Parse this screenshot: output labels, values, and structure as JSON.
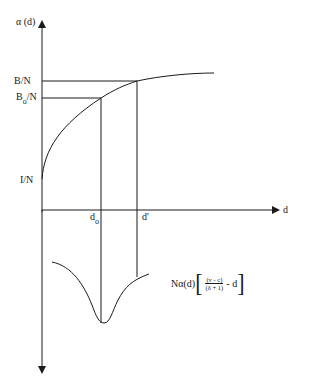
{
  "diagram": {
    "y_axis_label": "α (d)",
    "x_axis_label": "d",
    "y_ticks": [
      {
        "text": "B/N",
        "main": "B/N",
        "sub": ""
      },
      {
        "text": "Bo/N",
        "main": "B",
        "sub": "o",
        "rest": "/N"
      },
      {
        "text": "I/N",
        "main": "I/N",
        "sub": ""
      }
    ],
    "x_ticks": [
      {
        "text": "do",
        "main": "d",
        "sub": "o"
      },
      {
        "text": "d'",
        "main": "d'",
        "sub": ""
      }
    ],
    "formula": {
      "prefix": "Nα(d)",
      "open_bracket": "[",
      "numerator": "(v - c)",
      "denominator": "(δ + 1)",
      "suffix": "- d",
      "close_bracket": "]"
    },
    "colors": {
      "stroke": "#1a1a1a",
      "background": "#ffffff"
    }
  }
}
